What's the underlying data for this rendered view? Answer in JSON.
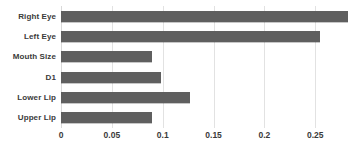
{
  "chart_data": {
    "type": "bar",
    "orientation": "horizontal",
    "title": "",
    "xlabel": "",
    "ylabel": "",
    "categories": [
      "Right Eye",
      "Left Eye",
      "Mouth Size",
      "D1",
      "Lower Lip",
      "Upper Lip"
    ],
    "values": [
      0.282,
      0.255,
      0.089,
      0.098,
      0.127,
      0.089
    ],
    "xlim": [
      0,
      0.29
    ],
    "xticks": [
      0,
      0.05,
      0.1,
      0.15,
      0.2,
      0.25
    ],
    "xtick_labels": [
      "0",
      "0.05",
      "0.1",
      "0.15",
      "0.2",
      "0.25"
    ],
    "grid": true,
    "legend": false,
    "series": [
      {
        "name": "",
        "values": [
          0.282,
          0.255,
          0.089,
          0.098,
          0.127,
          0.089
        ]
      }
    ]
  },
  "style": {
    "bar_color": "#5f5f5f",
    "gridline_color": "#e2e2e2",
    "label_color": "#3a3a3a",
    "background": "#ffffff"
  }
}
